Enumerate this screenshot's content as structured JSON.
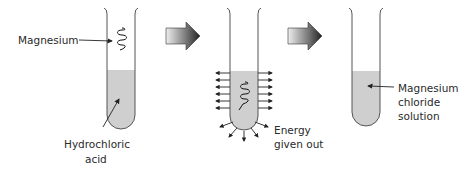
{
  "diagram": {
    "stages": [
      {
        "id": "before",
        "labels": {
          "magnesium": "Magnesium",
          "acid_line1": "Hydrochloric",
          "acid_line2": "acid"
        }
      },
      {
        "id": "reacting",
        "labels": {
          "energy_line1": "Energy",
          "energy_line2": "given out"
        }
      },
      {
        "id": "after",
        "labels": {
          "product_line1": "Magnesium",
          "product_line2": "chloride",
          "product_line3": "solution"
        }
      }
    ],
    "colors": {
      "liquid": "#cfcfcf",
      "glass": "#555555",
      "arrow_dark": "#2a2a2a",
      "arrow_light": "#e8e8e8"
    }
  }
}
